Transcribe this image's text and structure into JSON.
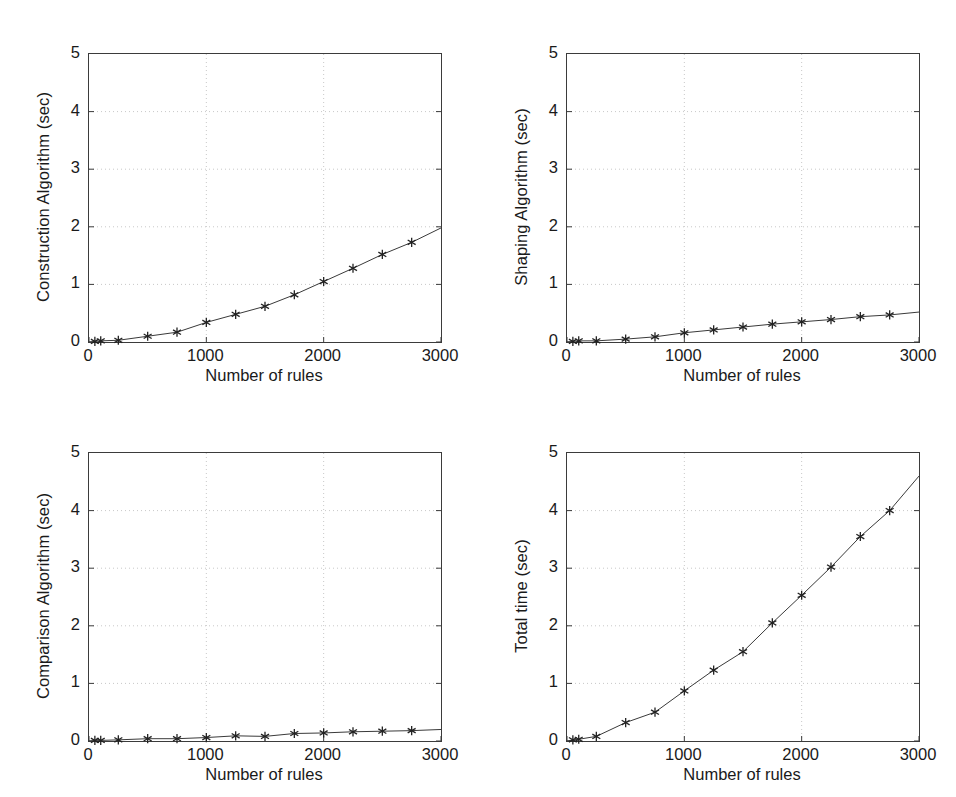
{
  "figure": {
    "background": "#ffffff",
    "axis_color": "#3b3b3b",
    "grid_color": "#c8c8c8",
    "line_color": "#3a3a3a",
    "marker_color": "#222222",
    "panel_count": 4
  },
  "common": {
    "xlabel": "Number of rules",
    "xticks": [
      "0",
      "1000",
      "2000",
      "3000"
    ],
    "xtick_values": [
      0,
      1000,
      2000,
      3000
    ],
    "yticks": [
      "0",
      "1",
      "2",
      "3",
      "4",
      "5"
    ],
    "ytick_values": [
      0,
      1,
      2,
      3,
      4,
      5
    ],
    "xlim": [
      0,
      3000
    ],
    "ylim": [
      0,
      5
    ],
    "grid": true,
    "marker": "asterisk",
    "legend": "none"
  },
  "chart_data": [
    {
      "type": "line",
      "panel": "top-left",
      "title": "",
      "xlabel": "Number of rules",
      "ylabel": "Construction Algorithm (sec)",
      "xlim": [
        0,
        3000
      ],
      "ylim": [
        0,
        5
      ],
      "xticks": [
        0,
        1000,
        2000,
        3000
      ],
      "yticks": [
        0,
        1,
        2,
        3,
        4,
        5
      ],
      "grid": true,
      "marker": "asterisk",
      "x": [
        50,
        100,
        250,
        500,
        750,
        1000,
        1250,
        1500,
        1750,
        2000,
        2250,
        2500,
        2750
      ],
      "y": [
        0.01,
        0.02,
        0.03,
        0.1,
        0.17,
        0.34,
        0.48,
        0.62,
        0.82,
        1.05,
        1.28,
        1.52,
        1.73
      ],
      "line_end": {
        "x": 3000,
        "y": 1.98
      }
    },
    {
      "type": "line",
      "panel": "top-right",
      "title": "",
      "xlabel": "Number of rules",
      "ylabel": "Shaping Algorithm (sec)",
      "xlim": [
        0,
        3000
      ],
      "ylim": [
        0,
        5
      ],
      "xticks": [
        0,
        1000,
        2000,
        3000
      ],
      "yticks": [
        0,
        1,
        2,
        3,
        4,
        5
      ],
      "grid": true,
      "marker": "asterisk",
      "x": [
        50,
        100,
        250,
        500,
        750,
        1000,
        1250,
        1500,
        1750,
        2000,
        2250,
        2500,
        2750
      ],
      "y": [
        0.01,
        0.02,
        0.02,
        0.05,
        0.09,
        0.16,
        0.21,
        0.26,
        0.31,
        0.35,
        0.39,
        0.44,
        0.47
      ],
      "line_end": {
        "x": 3000,
        "y": 0.52
      }
    },
    {
      "type": "line",
      "panel": "bottom-left",
      "title": "",
      "xlabel": "Number of rules",
      "ylabel": "Comparison Algorithm (sec)",
      "xlim": [
        0,
        3000
      ],
      "ylim": [
        0,
        5
      ],
      "xticks": [
        0,
        1000,
        2000,
        3000
      ],
      "yticks": [
        0,
        1,
        2,
        3,
        4,
        5
      ],
      "grid": true,
      "marker": "asterisk",
      "x": [
        50,
        100,
        250,
        500,
        750,
        1000,
        1250,
        1500,
        1750,
        2000,
        2250,
        2500,
        2750
      ],
      "y": [
        0.01,
        0.01,
        0.02,
        0.04,
        0.04,
        0.06,
        0.09,
        0.08,
        0.13,
        0.14,
        0.16,
        0.17,
        0.18
      ],
      "line_end": {
        "x": 3000,
        "y": 0.2
      }
    },
    {
      "type": "line",
      "panel": "bottom-right",
      "title": "",
      "xlabel": "Number of rules",
      "ylabel": "Total time (sec)",
      "xlim": [
        0,
        3000
      ],
      "ylim": [
        0,
        5
      ],
      "xticks": [
        0,
        1000,
        2000,
        3000
      ],
      "yticks": [
        0,
        1,
        2,
        3,
        4,
        5
      ],
      "grid": true,
      "marker": "asterisk",
      "x": [
        50,
        100,
        250,
        500,
        750,
        1000,
        1250,
        1500,
        1750,
        2000,
        2250,
        2500,
        2750
      ],
      "y": [
        0.02,
        0.03,
        0.08,
        0.32,
        0.5,
        0.87,
        1.23,
        1.55,
        2.05,
        2.53,
        3.02,
        3.55,
        4.0
      ],
      "line_end": {
        "x": 3000,
        "y": 4.6
      }
    }
  ]
}
